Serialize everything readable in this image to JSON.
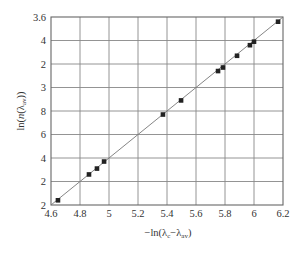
{
  "chart_data": {
    "type": "scatter",
    "title": "",
    "xlabel": "−ln(λc−λav)",
    "xlabel_parts": {
      "prefix": "−ln(λ",
      "sub1": "c",
      "mid": "−λ",
      "sub2": "av",
      "suffix": ")"
    },
    "ylabel": "ln(n(λav))",
    "ylabel_parts": {
      "prefix": "ln(",
      "italic": "n",
      "mid": "(λ",
      "sub": "av",
      "suffix": "))"
    },
    "xlim": [
      4.6,
      6.2
    ],
    "ylim": [
      2.0,
      3.6
    ],
    "x_ticks": [
      "4.6",
      "4.8",
      "5",
      "5.2",
      "5.4",
      "5.6",
      "5.8",
      "6",
      "6.2"
    ],
    "y_ticks_top_to_bottom": [
      "3.6",
      "4",
      "2",
      "3",
      "8",
      "6",
      "4",
      "2",
      "2"
    ],
    "grid": true,
    "legend": null,
    "series": [
      {
        "name": "data",
        "marker": "square",
        "color": "#222222",
        "x": [
          4.648,
          4.862,
          4.917,
          4.966,
          5.372,
          5.497,
          5.752,
          5.786,
          5.883,
          5.972,
          6.0,
          6.166
        ],
        "y": [
          2.04,
          2.26,
          2.31,
          2.37,
          2.77,
          2.89,
          3.14,
          3.17,
          3.27,
          3.36,
          3.39,
          3.56
        ]
      },
      {
        "name": "linear fit",
        "type": "line",
        "color": "#777777",
        "x": [
          4.6,
          6.2
        ],
        "y": [
          2.0,
          3.6
        ]
      }
    ]
  },
  "colors": {
    "frame": "#666666",
    "grid": "#888888",
    "marker": "#222222",
    "fit_line": "#777777",
    "text": "#333333"
  }
}
